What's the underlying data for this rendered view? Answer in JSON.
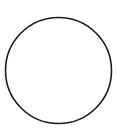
{
  "shape": {
    "type": "circle",
    "cx": 58.5,
    "cy": 70.5,
    "r": 53,
    "stroke": "#1a1a1a",
    "stroke_width": 1.6,
    "fill": "none"
  },
  "background": "#ffffff"
}
